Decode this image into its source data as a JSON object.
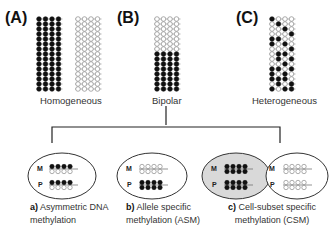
{
  "panels": [
    {
      "id": "A",
      "label": "(A)",
      "caption": "Homogeneous"
    },
    {
      "id": "B",
      "label": "(B)",
      "caption": "Bipolar"
    },
    {
      "id": "C",
      "label": "(C)",
      "caption": "Heterogeneous"
    }
  ],
  "subtypes": [
    {
      "id": "a",
      "prefix": "a)",
      "line1": "Asymmetric DNA",
      "line2": "methylation"
    },
    {
      "id": "b",
      "prefix": "b)",
      "line1": "Allele specific",
      "line2": "methylation (ASM)"
    },
    {
      "id": "c",
      "prefix": "c)",
      "line1": "Cell-subset specific",
      "line2": "methylation (CSM)"
    }
  ],
  "allele_labels": {
    "maternal": "M",
    "paternal": "P"
  },
  "colors": {
    "methylated": "#111111",
    "unmethylated": "#ffffff",
    "stroke": "#666666",
    "highlight_fill": "#d9d9d9"
  },
  "grids": {
    "rows": 15,
    "cols": 4,
    "A_left": "all-methylated",
    "A_right": "all-unmethylated",
    "B": "top-7-unmethylated-bottom-8-methylated",
    "C_pattern": [
      [
        1,
        0,
        0,
        0
      ],
      [
        0,
        1,
        0,
        0
      ],
      [
        0,
        0,
        1,
        0
      ],
      [
        0,
        0,
        0,
        1
      ],
      [
        1,
        1,
        0,
        0
      ],
      [
        1,
        0,
        1,
        0
      ],
      [
        0,
        0,
        0,
        1
      ],
      [
        0,
        1,
        1,
        0
      ],
      [
        0,
        1,
        0,
        1
      ],
      [
        0,
        0,
        1,
        0
      ],
      [
        1,
        1,
        0,
        1
      ],
      [
        1,
        0,
        1,
        0
      ],
      [
        1,
        1,
        1,
        0
      ],
      [
        0,
        1,
        0,
        1
      ],
      [
        1,
        0,
        1,
        1
      ]
    ]
  }
}
